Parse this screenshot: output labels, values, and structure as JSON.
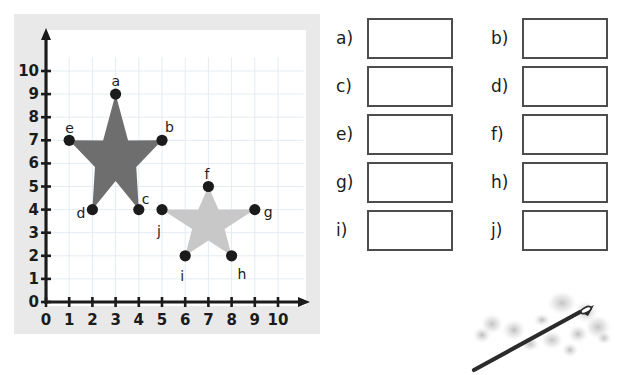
{
  "graph": {
    "name": "coordinate-plane-with-two-stars",
    "x_axis": {
      "label": "",
      "ticks": [
        "0",
        "1",
        "2",
        "3",
        "4",
        "5",
        "6",
        "7",
        "8",
        "9",
        "10"
      ],
      "min": 0,
      "max": 10
    },
    "y_axis": {
      "label": "",
      "ticks": [
        "0",
        "1",
        "2",
        "3",
        "4",
        "5",
        "6",
        "7",
        "8",
        "9",
        "10"
      ],
      "min": 0,
      "max": 10
    },
    "origin_label": "0",
    "grid": true,
    "colors": {
      "frame": "#e9e9e9",
      "plot_background": "#ffffff",
      "grid_line": "#e4ecf2",
      "axis": "#1b1b1b",
      "dark_star": "#6e6e6e",
      "light_star": "#c8c8c8",
      "point_marker": "#1b1b1b"
    },
    "shapes": [
      {
        "name": "dark-star",
        "fill": "#6e6e6e",
        "points": [
          {
            "label": "a",
            "x": 3,
            "y": 9
          },
          {
            "label": "b",
            "x": 5,
            "y": 7
          },
          {
            "label": "c",
            "x": 4,
            "y": 4
          },
          {
            "label": "d",
            "x": 2,
            "y": 4
          },
          {
            "label": "e",
            "x": 1,
            "y": 7
          }
        ]
      },
      {
        "name": "light-star",
        "fill": "#c8c8c8",
        "points": [
          {
            "label": "f",
            "x": 7,
            "y": 5
          },
          {
            "label": "g",
            "x": 9,
            "y": 4
          },
          {
            "label": "h",
            "x": 8,
            "y": 2
          },
          {
            "label": "i",
            "x": 6,
            "y": 2
          },
          {
            "label": "j",
            "x": 5,
            "y": 4
          }
        ]
      }
    ]
  },
  "answers": {
    "name": "answer-boxes",
    "items": [
      {
        "letter": "a)",
        "value": ""
      },
      {
        "letter": "b)",
        "value": ""
      },
      {
        "letter": "c)",
        "value": ""
      },
      {
        "letter": "d)",
        "value": ""
      },
      {
        "letter": "e)",
        "value": ""
      },
      {
        "letter": "f)",
        "value": ""
      },
      {
        "letter": "g)",
        "value": ""
      },
      {
        "letter": "h)",
        "value": ""
      },
      {
        "letter": "i)",
        "value": ""
      },
      {
        "letter": "j)",
        "value": ""
      }
    ]
  },
  "illustration": {
    "name": "needle-illustration",
    "description": "needle-icon"
  },
  "chart_data": {
    "type": "scatter",
    "title": "",
    "xlabel": "",
    "ylabel": "",
    "xlim": [
      0,
      10
    ],
    "ylim": [
      0,
      10
    ],
    "grid": true,
    "legend": "none",
    "xticks": [
      0,
      1,
      2,
      3,
      4,
      5,
      6,
      7,
      8,
      9,
      10
    ],
    "yticks": [
      0,
      1,
      2,
      3,
      4,
      5,
      6,
      7,
      8,
      9,
      10
    ],
    "series": [
      {
        "name": "dark-star-vertices",
        "color": "#6e6e6e",
        "labels": [
          "a",
          "b",
          "c",
          "d",
          "e"
        ],
        "x": [
          3,
          5,
          4,
          2,
          1
        ],
        "y": [
          9,
          7,
          4,
          4,
          7
        ]
      },
      {
        "name": "light-star-vertices",
        "color": "#c8c8c8",
        "labels": [
          "f",
          "g",
          "h",
          "i",
          "j"
        ],
        "x": [
          7,
          9,
          8,
          6,
          5
        ],
        "y": [
          5,
          4,
          2,
          2,
          4
        ]
      }
    ],
    "annotations": [
      {
        "text": "a",
        "x": 3,
        "y": 9
      },
      {
        "text": "b",
        "x": 5,
        "y": 7
      },
      {
        "text": "c",
        "x": 4,
        "y": 4
      },
      {
        "text": "d",
        "x": 2,
        "y": 4
      },
      {
        "text": "e",
        "x": 1,
        "y": 7
      },
      {
        "text": "f",
        "x": 7,
        "y": 5
      },
      {
        "text": "g",
        "x": 9,
        "y": 4
      },
      {
        "text": "h",
        "x": 8,
        "y": 2
      },
      {
        "text": "i",
        "x": 6,
        "y": 2
      },
      {
        "text": "j",
        "x": 5,
        "y": 4
      }
    ]
  }
}
